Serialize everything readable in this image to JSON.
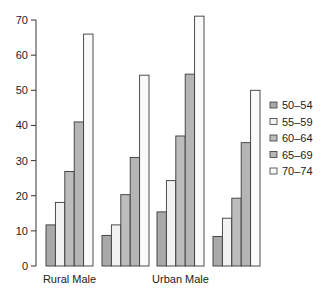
{
  "chart_data": {
    "type": "bar",
    "title": "",
    "xlabel": "",
    "ylabel": "",
    "ylim": [
      0,
      70
    ],
    "yticks": [
      0,
      10,
      20,
      30,
      40,
      50,
      60,
      70
    ],
    "grid": false,
    "legend_position": "right",
    "categories": [
      "Rural Male",
      "Rural Female",
      "Urban Male",
      "Urban Female"
    ],
    "visible_category_labels": [
      "Rural Male",
      "",
      "Urban Male",
      ""
    ],
    "series": [
      {
        "name": "50–54",
        "color": "#a9a9a9",
        "values": [
          11.7,
          8.7,
          15.4,
          8.4
        ]
      },
      {
        "name": "55–59",
        "color": "#f2f2f2",
        "values": [
          18.1,
          11.7,
          24.3,
          13.6
        ]
      },
      {
        "name": "60–64",
        "color": "#bcbcbc",
        "values": [
          26.9,
          20.3,
          37.0,
          19.3
        ]
      },
      {
        "name": "65–69",
        "color": "#b5b5b5",
        "values": [
          41.0,
          30.9,
          54.6,
          35.1
        ]
      },
      {
        "name": "70–74",
        "color": "#fafafa",
        "values": [
          66.0,
          54.3,
          71.1,
          50.0
        ]
      }
    ]
  },
  "layout": {
    "y0_px": 266,
    "px_per_unit": 3.514,
    "axis_x": 36,
    "group_starts": [
      46,
      102,
      157,
      213
    ],
    "bar_width": 9.4,
    "legend_x": 270,
    "legend_y": 105,
    "legend_step": 16.5
  }
}
